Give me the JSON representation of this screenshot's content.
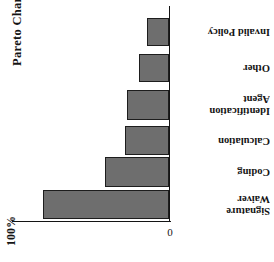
{
  "title": "Pareto Chart",
  "axis": {
    "value_max_label": "100%",
    "value_zero_label": "0"
  },
  "chart_data": {
    "type": "bar",
    "title": "Pareto Chart",
    "orientation": "horizontal",
    "xlabel": "",
    "ylabel": "",
    "grid": false,
    "legend": false,
    "axis_tick_labels": [
      "0",
      "100%"
    ],
    "xlim": [
      0,
      100
    ],
    "categories": [
      "Waiver Signature",
      "Coding",
      "Calculation",
      "Agent Identification",
      "Other",
      "Invalid Policy"
    ],
    "values": [
      50,
      26,
      18,
      17,
      12,
      9
    ],
    "series": [
      {
        "name": "Defect Count",
        "values": [
          50,
          26,
          18,
          17,
          12,
          9
        ]
      }
    ]
  },
  "bars": [
    {
      "label": "Invalid Policy",
      "label_lines": "Invalid Policy",
      "value": 9,
      "top": 18,
      "height": 28,
      "length": 14
    },
    {
      "label": "Other",
      "label_lines": "Other",
      "value": 12,
      "top": 54,
      "height": 28,
      "length": 19
    },
    {
      "label": "Agent Identification",
      "label_lines": "Agent\nIdentification",
      "value": 17,
      "top": 90,
      "height": 30,
      "length": 27
    },
    {
      "label": "Calculation",
      "label_lines": "Calculation",
      "value": 18,
      "top": 126,
      "height": 29,
      "length": 28
    },
    {
      "label": "Coding",
      "label_lines": "Coding",
      "value": 26,
      "top": 157,
      "height": 30,
      "length": 41
    },
    {
      "label": "Waiver Signature",
      "label_lines": "Waiver\nSignature",
      "value": 50,
      "top": 190,
      "height": 29,
      "length": 80
    }
  ],
  "colors": {
    "bar_fill": "#6e6e6e",
    "bar_border": "#1d1d1d",
    "axis": "#141414",
    "text": "#141414",
    "background": "#ffffff"
  }
}
